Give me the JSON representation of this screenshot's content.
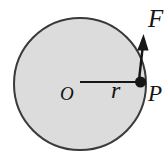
{
  "diagram": {
    "type": "circle-with-tangential-force",
    "labels": {
      "force": "F",
      "center": "O",
      "radius": "r",
      "point": "P"
    },
    "colors": {
      "background": "#ffffff",
      "circle_fill": "#dcdcdc",
      "circle_stroke": "#3a3a3a",
      "ink": "#161616"
    }
  }
}
